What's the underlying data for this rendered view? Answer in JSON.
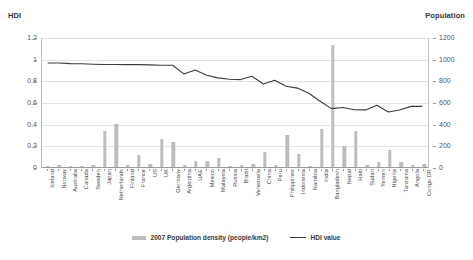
{
  "axes": {
    "left_title": "HDI",
    "right_title": "Population"
  },
  "legend": {
    "bar_label": "2007 Population density (people/km2)",
    "line_label": "HDI  value"
  },
  "colors": {
    "bar": "#bdbdbd",
    "line": "#3b3b3b",
    "grid": "#e2e2e2",
    "axis": "#9a9a9a",
    "text": "#3a3a3a"
  },
  "chart_data": {
    "type": "bar",
    "title": "",
    "xlabel": "",
    "ylabel": "HDI",
    "ylabel_secondary": "Population",
    "ylim": [
      0,
      1.2
    ],
    "ylim_secondary": [
      0,
      1200
    ],
    "yticks": [
      "0",
      "0.2",
      "0.4",
      "0.6",
      "0.8",
      "1",
      "1.2"
    ],
    "yticks_secondary": [
      "0",
      "200",
      "400",
      "600",
      "800",
      "1000",
      "1200"
    ],
    "grid": true,
    "legend_position": "bottom",
    "categories": [
      "Iceland",
      "Norway",
      "Australia",
      "Canada",
      "Sweden",
      "Japan",
      "Netherlands",
      "Finland",
      "France",
      "US",
      "UK",
      "Germany",
      "Argentina",
      "UAE",
      "Mexico",
      "Malaysia",
      "Russia",
      "Brazil",
      "Venezuela",
      "China",
      "Peru",
      "Philippines",
      "Indonesia",
      "Namibia",
      "India",
      "Bangladesh",
      "Nepal",
      "Haiti",
      "Sudan",
      "Yemen",
      "Nigeria",
      "Tanzania",
      "Angola",
      "Congo DR"
    ],
    "series": [
      {
        "name": "2007 Population density (people/km2)",
        "axis": "secondary",
        "chart_type": "bar",
        "values": [
          3,
          15,
          3,
          3,
          20,
          337,
          395,
          16,
          115,
          32,
          255,
          230,
          15,
          55,
          56,
          82,
          8,
          22,
          32,
          140,
          23,
          295,
          124,
          2,
          355,
          1127,
          190,
          330,
          17,
          42,
          160,
          45,
          14,
          28
        ]
      },
      {
        "name": "HDI  value",
        "axis": "primary",
        "chart_type": "line",
        "values": [
          0.968,
          0.968,
          0.962,
          0.961,
          0.956,
          0.953,
          0.953,
          0.952,
          0.952,
          0.95,
          0.947,
          0.947,
          0.866,
          0.903,
          0.854,
          0.829,
          0.817,
          0.813,
          0.844,
          0.772,
          0.806,
          0.751,
          0.734,
          0.686,
          0.612,
          0.543,
          0.553,
          0.532,
          0.531,
          0.575,
          0.511,
          0.53,
          0.564,
          0.564
        ]
      }
    ]
  }
}
